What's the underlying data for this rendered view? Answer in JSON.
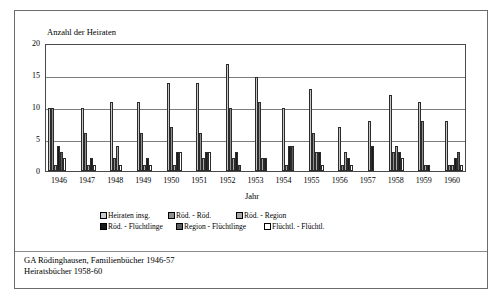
{
  "figure": {
    "y_axis_title": "Anzahl der Heiraten",
    "x_axis_title": "Jahr"
  },
  "footer": {
    "line1": "GA Rödinghausen, Familienbücher 1946-57",
    "line2": "Heiratsbücher 1958-60"
  },
  "colors": {
    "series1": "#c9c9c9",
    "series2": "#8f8f8f",
    "series3": "#a8a8a8",
    "series4": "#1a1a1a",
    "series5": "#5e5e5e",
    "series6": "#ffffff",
    "axis": "#4a4a4a",
    "grid": "#7d7d7d",
    "frame": "#6b6b6b"
  },
  "chart_data": {
    "type": "bar",
    "title": "",
    "xlabel": "Jahr",
    "ylabel": "Anzahl der Heiraten",
    "ylim": [
      0,
      20
    ],
    "yticks": [
      0,
      5,
      10,
      15,
      20
    ],
    "grid": true,
    "legend_position": "bottom",
    "categories": [
      "1946",
      "1947",
      "1948",
      "1949",
      "1950",
      "1951",
      "1952",
      "1953",
      "1954",
      "1955",
      "1956",
      "1957",
      "1958",
      "1959",
      "1960"
    ],
    "series": [
      {
        "name": "Heiraten insg.",
        "color": "#c9c9c9",
        "values": [
          10,
          10,
          11,
          11,
          14,
          14,
          17,
          15,
          10,
          13,
          7,
          8,
          12,
          11,
          8
        ]
      },
      {
        "name": "Röd. - Röd.",
        "color": "#8f8f8f",
        "values": [
          10,
          6,
          2,
          6,
          7,
          6,
          10,
          11,
          0,
          6,
          1,
          0,
          3,
          8,
          1
        ]
      },
      {
        "name": "Röd. - Region",
        "color": "#a8a8a8",
        "values": [
          1,
          1,
          4,
          1,
          1,
          2,
          2,
          2,
          1,
          3,
          3,
          0,
          4,
          1,
          1
        ]
      },
      {
        "name": "Röd. - Flüchtlinge",
        "color": "#1a1a1a",
        "values": [
          4,
          2,
          0,
          2,
          3,
          3,
          3,
          2,
          4,
          3,
          2,
          4,
          3,
          1,
          2
        ]
      },
      {
        "name": "Region - Flüchtlinge",
        "color": "#5e5e5e",
        "values": [
          3,
          0,
          0,
          0,
          0,
          0,
          1,
          0,
          4,
          0,
          0,
          0,
          0,
          0,
          3
        ]
      },
      {
        "name": "Flüchtl. - Flüchtl.",
        "color": "#ffffff",
        "values": [
          2,
          1,
          1,
          1,
          3,
          3,
          0,
          0,
          0,
          1,
          1,
          0,
          2,
          0,
          1
        ]
      }
    ]
  }
}
